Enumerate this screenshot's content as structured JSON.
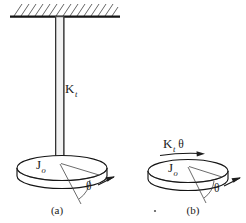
{
  "figure": {
    "ink_color": "#1e1e1e",
    "background_color": "#ffffff",
    "panels": [
      {
        "id": "a",
        "caption": "(a)",
        "caption_x": 57,
        "caption_y": 214,
        "description": "Disk suspended by a torsional shaft from a fixed hatched support",
        "labels": {
          "stiffness": "K",
          "stiffness_sub": "t",
          "inertia": "J",
          "inertia_sub": "o",
          "angle": "θ"
        },
        "label_positions": {
          "stiffness_x": 65,
          "stiffness_y": 93,
          "inertia_x": 36,
          "inertia_y": 169,
          "angle_x": 86,
          "angle_y": 190
        }
      },
      {
        "id": "b",
        "caption": "(b)",
        "caption_x": 193,
        "caption_y": 214,
        "description": "Free-body diagram of the disk showing restoring torque",
        "labels": {
          "torque": "K",
          "torque_sub": "t",
          "torque_angle": "θ",
          "inertia": "J",
          "inertia_sub": "o",
          "angle": "θ"
        },
        "label_positions": {
          "torque_x": 163,
          "torque_y": 148,
          "inertia_x": 168,
          "inertia_y": 172,
          "angle_x": 214,
          "angle_y": 192
        }
      }
    ],
    "stray_mark": {
      "name": "stray-dot",
      "x": 155,
      "y": 211
    }
  }
}
